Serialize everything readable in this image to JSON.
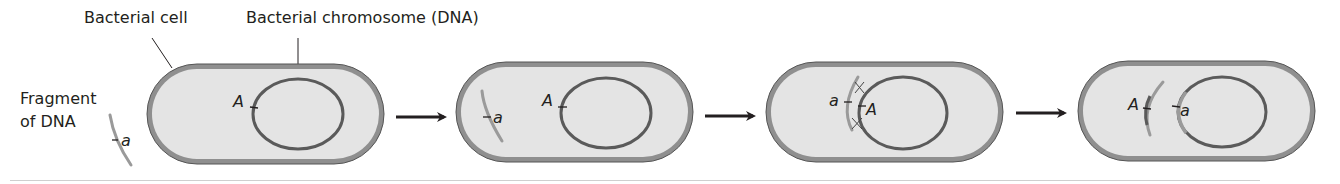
{
  "labels": {
    "bacterial_cell": "Bacterial cell",
    "bacterial_chromosome": "Bacterial chromosome (DNA)",
    "fragment_line1": "Fragment",
    "fragment_line2": "of DNA"
  },
  "alleles": {
    "chromosome_allele": "A",
    "fragment_allele": "a"
  },
  "panels": [
    {
      "step": 1,
      "a_label": "A",
      "frag_label": "a",
      "description": "DNA fragment outside bacterial cell"
    },
    {
      "step": 2,
      "a_label": "A",
      "frag_label": "a",
      "description": "Fragment enters cell"
    },
    {
      "step": 3,
      "a_label": "A",
      "frag_label": "a",
      "description": "Fragment pairs with chromosome, crossing over"
    },
    {
      "step": 4,
      "a_label": "A",
      "frag_label": "a",
      "description": "Allele a replaces A in chromosome"
    }
  ],
  "colors": {
    "cell_fill": "#e4e4e4",
    "cell_border": "#8a8a8a",
    "cell_outline": "#555555",
    "chromosome": "#5a5a5a",
    "fragment": "#9a9a9a",
    "arrow": "#231f20",
    "text": "#231f20"
  }
}
